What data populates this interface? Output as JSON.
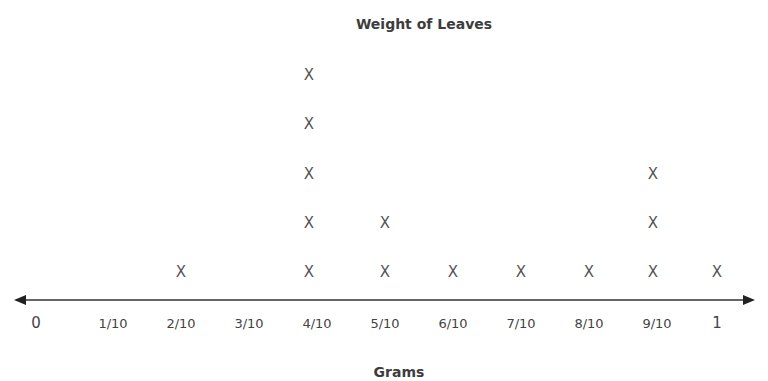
{
  "chart_data": {
    "type": "line-plot",
    "title": "Weight of Leaves",
    "xlabel": "Grams",
    "ylabel": "",
    "marker": "X",
    "categories": [
      "0",
      "1/10",
      "2/10",
      "3/10",
      "4/10",
      "5/10",
      "6/10",
      "7/10",
      "8/10",
      "9/10",
      "1"
    ],
    "values": [
      0,
      0,
      1,
      0,
      5,
      2,
      1,
      1,
      1,
      3,
      1
    ],
    "xlim": [
      0,
      1
    ],
    "grid": false
  },
  "layout": {
    "tick_x": [
      36,
      113,
      181,
      249,
      317,
      385,
      453,
      521,
      589,
      657,
      717
    ],
    "mark_x": [
      36,
      113,
      181,
      249,
      309,
      385,
      453,
      521,
      589,
      653,
      717
    ],
    "row_y": [
      272,
      223,
      174,
      124,
      75
    ],
    "axis_y": 300,
    "colors": {
      "axis": "#333333",
      "marker": "#555555",
      "text": "#444444"
    }
  }
}
